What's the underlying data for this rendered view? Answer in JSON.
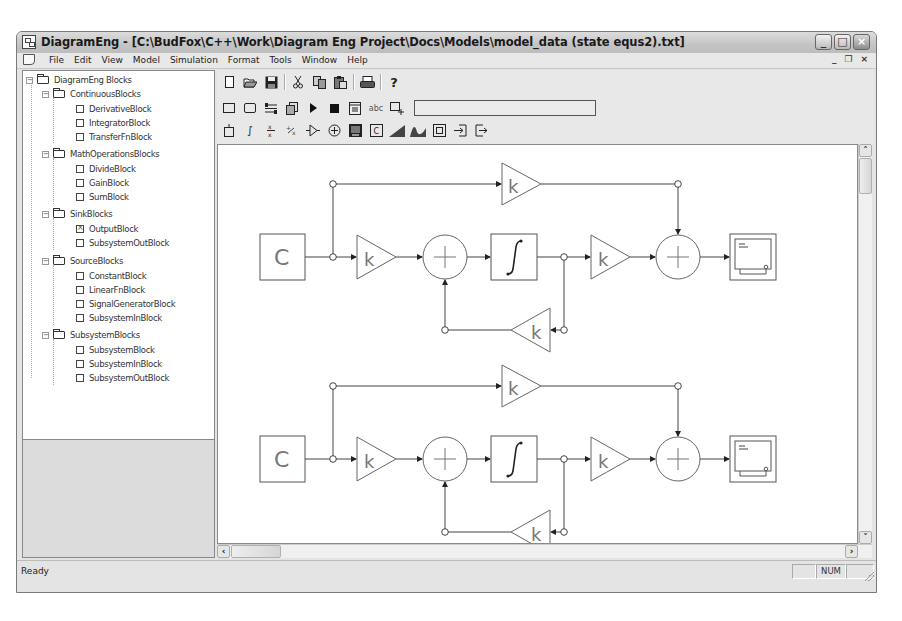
{
  "window": {
    "title": "DiagramEng - [C:\\BudFox\\C++\\Work\\Diagram Eng Project\\Docs\\Models\\model_data (state equs2).txt]",
    "controls": {
      "minimize": "_",
      "maximize": "□",
      "close": "×"
    },
    "mdi_controls": {
      "minimize": "_",
      "restore": "❐",
      "close": "×"
    }
  },
  "menubar": {
    "items": [
      {
        "label": "File",
        "mnemonic": "F"
      },
      {
        "label": "Edit",
        "mnemonic": "E"
      },
      {
        "label": "View",
        "mnemonic": "V"
      },
      {
        "label": "Model",
        "mnemonic": "M"
      },
      {
        "label": "Simulation",
        "mnemonic": "S"
      },
      {
        "label": "Format",
        "mnemonic": "o"
      },
      {
        "label": "Tools",
        "mnemonic": "T"
      },
      {
        "label": "Window",
        "mnemonic": "W"
      },
      {
        "label": "Help",
        "mnemonic": "H"
      }
    ]
  },
  "tree": {
    "root": "DiagramEng Blocks",
    "groups": [
      {
        "label": "ContinuousBlocks",
        "items": [
          "DerivativeBlock",
          "IntegratorBlock",
          "TransferFnBlock"
        ]
      },
      {
        "label": "MathOperationsBlocks",
        "items": [
          "DivideBlock",
          "GainBlock",
          "SumBlock"
        ]
      },
      {
        "label": "SinkBlocks",
        "items": [
          "OutputBlock",
          "SubsystemOutBlock"
        ]
      },
      {
        "label": "SourceBlocks",
        "items": [
          "ConstantBlock",
          "LinearFnBlock",
          "SignalGeneratorBlock",
          "SubsystemInBlock"
        ]
      },
      {
        "label": "SubsystemBlocks",
        "items": [
          "SubsystemBlock",
          "SubsystemInBlock",
          "SubsystemOutBlock"
        ]
      }
    ],
    "checked_item": "OutputBlock"
  },
  "toolbars": {
    "main": [
      "new-icon",
      "open-icon",
      "save-icon",
      "cut-icon",
      "copy-icon",
      "paste-icon",
      "print-icon",
      "help-icon"
    ],
    "common_ops": [
      "select-all-icon",
      "add-multiple-blocks-icon",
      "auto-fit-icon",
      "build-model-icon",
      "start-simulation-icon",
      "stop-simulation-icon",
      "numerical-solver-icon",
      "text-annotation-icon",
      "net-connection-icon"
    ],
    "common_ops_field_value": "",
    "blocks": [
      "derivative-block-icon",
      "integrator-block-icon",
      "transfer-fn-block-icon",
      "divide-block-icon",
      "gain-block-icon",
      "sum-block-icon",
      "output-block-icon",
      "constant-block-icon",
      "linear-fn-block-icon",
      "signal-generator-block-icon",
      "subsystem-block-icon",
      "subsystem-in-block-icon",
      "subsystem-out-block-icon"
    ],
    "text_label_abc": "abc"
  },
  "diagram": {
    "constant_label": "C",
    "gain_label": "k",
    "sum_label": "+",
    "integrator_label": "∫",
    "systems": 2
  },
  "statusbar": {
    "text": "Ready",
    "panels": [
      "",
      "NUM",
      ""
    ]
  },
  "scroll": {
    "up": "˄",
    "down": "˅",
    "left": "‹",
    "right": "›"
  }
}
